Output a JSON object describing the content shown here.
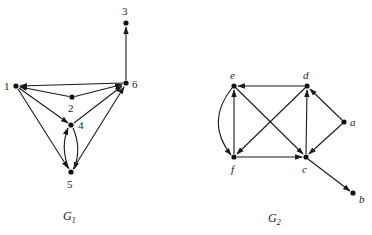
{
  "figure": {
    "graphs": [
      {
        "id": "G1",
        "caption": {
          "main": "G",
          "subscript": "1"
        },
        "nodes": [
          {
            "id": "1",
            "label": "1",
            "x": 16,
            "y": 86
          },
          {
            "id": "2",
            "label": "2",
            "x": 72,
            "y": 97
          },
          {
            "id": "3",
            "label": "3",
            "x": 126,
            "y": 23
          },
          {
            "id": "4",
            "label": "4",
            "x": 71,
            "y": 125
          },
          {
            "id": "5",
            "label": "5",
            "x": 71,
            "y": 172
          },
          {
            "id": "6",
            "label": "6",
            "x": 126,
            "y": 83
          }
        ],
        "edges": [
          {
            "from": "6",
            "to": "1"
          },
          {
            "from": "2",
            "to": "1"
          },
          {
            "from": "2",
            "to": "6"
          },
          {
            "from": "1",
            "to": "4"
          },
          {
            "from": "1",
            "to": "5"
          },
          {
            "from": "4",
            "to": "6"
          },
          {
            "from": "5",
            "to": "6"
          },
          {
            "from": "5",
            "to": "4",
            "curved": "left"
          },
          {
            "from": "4",
            "to": "5",
            "curved": "right"
          },
          {
            "from": "6",
            "to": "3"
          }
        ]
      },
      {
        "id": "G2",
        "caption": {
          "main": "G",
          "subscript": "2"
        },
        "nodes": [
          {
            "id": "e",
            "label": "e",
            "x": 234,
            "y": 86
          },
          {
            "id": "d",
            "label": "d",
            "x": 307,
            "y": 86
          },
          {
            "id": "a",
            "label": "a",
            "x": 344,
            "y": 122
          },
          {
            "id": "f",
            "label": "f",
            "x": 234,
            "y": 157
          },
          {
            "id": "c",
            "label": "c",
            "x": 306,
            "y": 157
          },
          {
            "id": "b",
            "label": "b",
            "x": 353,
            "y": 193
          }
        ],
        "edges": [
          {
            "from": "d",
            "to": "e"
          },
          {
            "from": "f",
            "to": "e"
          },
          {
            "from": "e",
            "to": "c"
          },
          {
            "from": "d",
            "to": "f"
          },
          {
            "from": "f",
            "to": "c"
          },
          {
            "from": "c",
            "to": "d"
          },
          {
            "from": "a",
            "to": "d"
          },
          {
            "from": "a",
            "to": "c"
          },
          {
            "from": "c",
            "to": "b"
          },
          {
            "from": "e",
            "to": "f",
            "curved": "left"
          }
        ]
      }
    ]
  }
}
